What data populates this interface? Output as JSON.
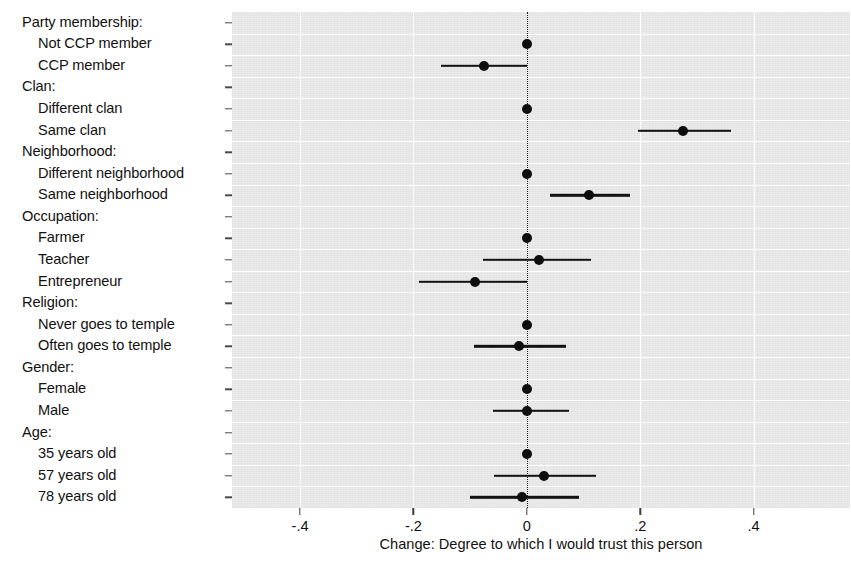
{
  "chart_data": {
    "type": "scatter",
    "title": "",
    "xlabel": "Change: Degree to which I would trust this person",
    "ylabel": "",
    "xlim": [
      -0.52,
      0.57
    ],
    "xticks": [
      -0.4,
      -0.2,
      0,
      0.2,
      0.4
    ],
    "xticklabels": [
      "-.4",
      "-.2",
      "0",
      ".2",
      ".4"
    ],
    "grid": true,
    "legend": false,
    "zero_reference_line": 0,
    "orientation": "horizontal",
    "note": "Coefficient plot with point estimates and confidence intervals; reference categories fixed at 0 with no interval.",
    "rows": [
      {
        "label": "Party membership:",
        "kind": "header"
      },
      {
        "label": "Not CCP member",
        "kind": "point",
        "estimate": 0.0,
        "ci_low": null,
        "ci_high": null,
        "reference": true
      },
      {
        "label": "CCP member",
        "kind": "point",
        "estimate": -0.075,
        "ci_low": -0.152,
        "ci_high": 0.0,
        "reference": false
      },
      {
        "label": "Clan:",
        "kind": "header"
      },
      {
        "label": "Different clan",
        "kind": "point",
        "estimate": 0.0,
        "ci_low": null,
        "ci_high": null,
        "reference": true
      },
      {
        "label": "Same clan",
        "kind": "point",
        "estimate": 0.276,
        "ci_low": 0.196,
        "ci_high": 0.361,
        "reference": false
      },
      {
        "label": "Neighborhood:",
        "kind": "header"
      },
      {
        "label": "Different neighborhood",
        "kind": "point",
        "estimate": 0.0,
        "ci_low": null,
        "ci_high": null,
        "reference": true
      },
      {
        "label": "Same neighborhood",
        "kind": "point",
        "estimate": 0.11,
        "ci_low": 0.041,
        "ci_high": 0.182,
        "reference": false
      },
      {
        "label": "Occupation:",
        "kind": "header"
      },
      {
        "label": "Farmer",
        "kind": "point",
        "estimate": 0.0,
        "ci_low": null,
        "ci_high": null,
        "reference": true
      },
      {
        "label": "Teacher",
        "kind": "point",
        "estimate": 0.021,
        "ci_low": -0.078,
        "ci_high": 0.113,
        "reference": false
      },
      {
        "label": "Entrepreneur",
        "kind": "point",
        "estimate": -0.092,
        "ci_low": -0.19,
        "ci_high": 0.0,
        "reference": false
      },
      {
        "label": "Religion:",
        "kind": "header"
      },
      {
        "label": "Never goes to temple",
        "kind": "point",
        "estimate": 0.0,
        "ci_low": null,
        "ci_high": null,
        "reference": true
      },
      {
        "label": "Often goes to temple",
        "kind": "point",
        "estimate": -0.014,
        "ci_low": -0.094,
        "ci_high": 0.069,
        "reference": false
      },
      {
        "label": "Gender:",
        "kind": "header"
      },
      {
        "label": "Female",
        "kind": "point",
        "estimate": 0.0,
        "ci_low": null,
        "ci_high": null,
        "reference": true
      },
      {
        "label": "Male",
        "kind": "point",
        "estimate": 0.001,
        "ci_low": -0.06,
        "ci_high": 0.074,
        "reference": false
      },
      {
        "label": "Age:",
        "kind": "header"
      },
      {
        "label": "35 years old",
        "kind": "point",
        "estimate": 0.0,
        "ci_low": null,
        "ci_high": null,
        "reference": true
      },
      {
        "label": "57 years old",
        "kind": "point",
        "estimate": 0.03,
        "ci_low": -0.058,
        "ci_high": 0.122,
        "reference": false
      },
      {
        "label": "78 years old",
        "kind": "point",
        "estimate": -0.009,
        "ci_low": -0.101,
        "ci_high": 0.092,
        "reference": false
      }
    ]
  },
  "style": {
    "plot_background": "#ebebeb",
    "grid_color": "#ffffff",
    "marker_color": "#0d0d0d",
    "page_background": "#ffffff"
  }
}
